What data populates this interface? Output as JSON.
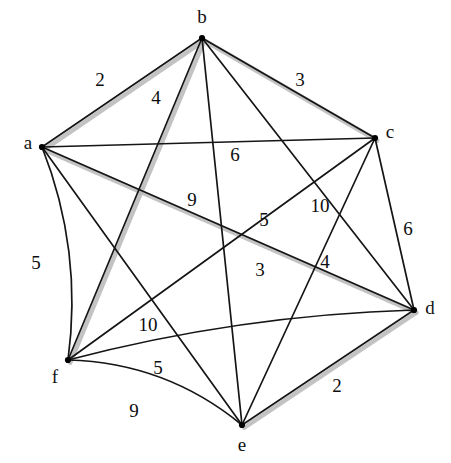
{
  "figure": {
    "type": "weighted-undirected-graph",
    "title": "",
    "background": "#ffffff",
    "edge_color": "#151515",
    "shadow_color": "#b8b8b8",
    "node_color": "#000000"
  },
  "nodes": [
    {
      "id": "a",
      "label": "a",
      "x": 42,
      "y": 147,
      "label_x": 28,
      "label_y": 145
    },
    {
      "id": "b",
      "label": "b",
      "x": 202,
      "y": 38,
      "label_x": 202,
      "label_y": 19
    },
    {
      "id": "c",
      "label": "c",
      "x": 375,
      "y": 138,
      "label_x": 390,
      "label_y": 134
    },
    {
      "id": "d",
      "label": "d",
      "x": 414,
      "y": 310,
      "label_x": 430,
      "label_y": 310
    },
    {
      "id": "e",
      "label": "e",
      "x": 242,
      "y": 425,
      "label_x": 242,
      "label_y": 447
    },
    {
      "id": "f",
      "label": "f",
      "x": 68,
      "y": 360,
      "label_x": 55,
      "label_y": 379
    }
  ],
  "edges": [
    {
      "id": "ab",
      "from": "a",
      "to": "b",
      "weight": "2",
      "weight_x": 100,
      "weight_y": 82,
      "shadow": true,
      "curve": 0
    },
    {
      "id": "bc",
      "from": "b",
      "to": "c",
      "weight": "3",
      "weight_x": 300,
      "weight_y": 82,
      "shadow": true,
      "curve": 0
    },
    {
      "id": "ac",
      "from": "a",
      "to": "c",
      "weight": "6",
      "weight_x": 235,
      "weight_y": 157,
      "shadow": false,
      "curve": 0
    },
    {
      "id": "bf",
      "from": "b",
      "to": "f",
      "weight": "4",
      "weight_x": 156,
      "weight_y": 100,
      "shadow": true,
      "curve": 0
    },
    {
      "id": "be",
      "from": "b",
      "to": "e",
      "weight": "9",
      "weight_x": 192,
      "weight_y": 202,
      "shadow": false,
      "curve": 0
    },
    {
      "id": "bd",
      "from": "b",
      "to": "d",
      "weight": "10",
      "weight_x": 320,
      "weight_y": 208,
      "shadow": false,
      "curve": 0
    },
    {
      "id": "cd",
      "from": "c",
      "to": "d",
      "weight": "6",
      "weight_x": 408,
      "weight_y": 231,
      "shadow": false,
      "curve": 0
    },
    {
      "id": "ce",
      "from": "c",
      "to": "e",
      "weight": "4",
      "weight_x": 325,
      "weight_y": 264,
      "shadow": false,
      "curve": 0
    },
    {
      "id": "cf",
      "from": "c",
      "to": "f",
      "weight": "5",
      "weight_x": 264,
      "weight_y": 222,
      "shadow": false,
      "curve": 0
    },
    {
      "id": "ad",
      "from": "a",
      "to": "d",
      "weight": "3",
      "weight_x": 260,
      "weight_y": 272,
      "shadow": true,
      "curve": 0
    },
    {
      "id": "af",
      "from": "a",
      "to": "f",
      "weight": "5",
      "weight_x": 36,
      "weight_y": 265,
      "shadow": false,
      "curve": -14
    },
    {
      "id": "ae",
      "from": "a",
      "to": "e",
      "weight": "10",
      "weight_x": 148,
      "weight_y": 327,
      "shadow": false,
      "curve": 0
    },
    {
      "id": "fd",
      "from": "f",
      "to": "d",
      "weight": "5",
      "weight_x": 158,
      "weight_y": 370,
      "shadow": false,
      "curve": -10
    },
    {
      "id": "fe",
      "from": "f",
      "to": "e",
      "weight": "9",
      "weight_x": 134,
      "weight_y": 413,
      "shadow": false,
      "curve": -16
    },
    {
      "id": "ed",
      "from": "e",
      "to": "d",
      "weight": "2",
      "weight_x": 337,
      "weight_y": 388,
      "shadow": true,
      "curve": 0
    }
  ],
  "chart_data": {
    "type": "diagram",
    "subtype": "complete-graph-K6",
    "title": "",
    "vertices": [
      "a",
      "b",
      "c",
      "d",
      "e",
      "f"
    ],
    "edge_list": [
      {
        "u": "a",
        "v": "b",
        "w": 2
      },
      {
        "u": "a",
        "v": "c",
        "w": 6
      },
      {
        "u": "a",
        "v": "d",
        "w": 3
      },
      {
        "u": "a",
        "v": "e",
        "w": 10
      },
      {
        "u": "a",
        "v": "f",
        "w": 5
      },
      {
        "u": "b",
        "v": "c",
        "w": 3
      },
      {
        "u": "b",
        "v": "d",
        "w": 10
      },
      {
        "u": "b",
        "v": "e",
        "w": 9
      },
      {
        "u": "b",
        "v": "f",
        "w": 4
      },
      {
        "u": "c",
        "v": "d",
        "w": 6
      },
      {
        "u": "c",
        "v": "e",
        "w": 4
      },
      {
        "u": "c",
        "v": "f",
        "w": 5
      },
      {
        "u": "d",
        "v": "e",
        "w": 2
      },
      {
        "u": "d",
        "v": "f",
        "w": 5
      },
      {
        "u": "e",
        "v": "f",
        "w": 9
      }
    ],
    "weights": [
      2,
      3,
      4,
      6,
      9,
      10,
      3,
      5,
      10,
      6,
      5,
      4,
      5,
      9,
      2
    ],
    "edge_count": 15,
    "vertex_count": 6,
    "directed": false,
    "weighted": true
  }
}
